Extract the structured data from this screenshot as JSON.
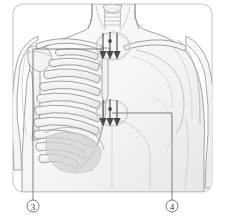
{
  "figure": {
    "frame": {
      "border_color": "#c9c9c9",
      "background": "#ffffff",
      "corner_radius": 10
    },
    "body_outline_color": "#8d8d8d",
    "rib_color": "#7b7b7b",
    "shading_color": "#d9d9d9",
    "leader_line_color": "#6e6e6e",
    "arrow_color": "#4a4a4a",
    "highlight_color": "#bcbcbc"
  },
  "callouts": [
    {
      "id": "callout-3",
      "label": "3",
      "marker_x": 33,
      "marker_y": 206,
      "radius": 6,
      "leader": "M33,200 L33,49 L104,49"
    },
    {
      "id": "callout-4",
      "label": "4",
      "marker_x": 172,
      "marker_y": 206,
      "radius": 6,
      "leader": "M172,200 L172,113 L112,113"
    }
  ],
  "highlight_zones": [
    {
      "id": "upper-auscultation-zone",
      "name": "upper arrow cluster",
      "cx": 113,
      "cy": 46,
      "rx": 17,
      "ry": 14,
      "arrow_count": 3
    },
    {
      "id": "lower-auscultation-zone",
      "name": "lower arrow cluster",
      "cx": 112,
      "cy": 113,
      "rx": 16,
      "ry": 13,
      "arrow_count": 3
    }
  ],
  "arrows": {
    "direction": "down",
    "upper": [
      {
        "x": 103,
        "y1": 33,
        "y2": 58
      },
      {
        "x": 110,
        "y1": 32,
        "y2": 58
      },
      {
        "x": 117,
        "y1": 33,
        "y2": 58
      }
    ],
    "lower": [
      {
        "x": 103,
        "y1": 100,
        "y2": 125
      },
      {
        "x": 110,
        "y1": 99,
        "y2": 125
      },
      {
        "x": 117,
        "y1": 100,
        "y2": 125
      }
    ]
  },
  "anatomy": {
    "structures": [
      "neck",
      "trachea",
      "clavicle-left",
      "clavicle-right",
      "sternum",
      "rib-cage",
      "costal-cartilage",
      "scapula",
      "humerus",
      "shoulder-deltoid",
      "pectoral-contour",
      "diaphragm",
      "abdomen"
    ],
    "rib_pairs": 10
  }
}
